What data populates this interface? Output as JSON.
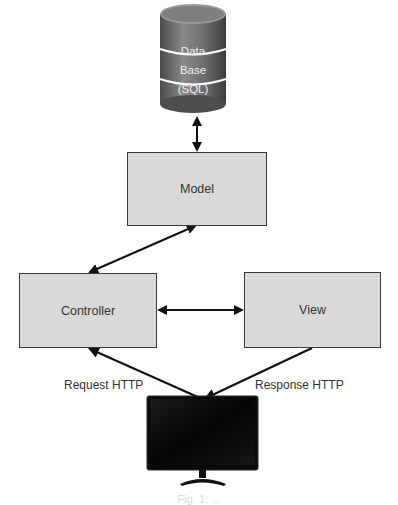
{
  "diagram": {
    "type": "MVC architecture",
    "database": {
      "lines": [
        "Data",
        "Base",
        "(SQL)"
      ]
    },
    "nodes": {
      "model": "Model",
      "controller": "Controller",
      "view": "View",
      "client": "Monitor"
    },
    "edge_labels": {
      "request": "Request HTTP",
      "response": "Response HTTP"
    },
    "edges": [
      {
        "from": "database",
        "to": "model",
        "direction": "both"
      },
      {
        "from": "model",
        "to": "controller",
        "direction": "both"
      },
      {
        "from": "controller",
        "to": "view",
        "direction": "both"
      },
      {
        "from": "client",
        "to": "controller",
        "label": "Request HTTP"
      },
      {
        "from": "view",
        "to": "client",
        "label": "Response HTTP"
      }
    ],
    "colors": {
      "box_fill": "#d9d9d9",
      "box_border": "#3a3a3a",
      "arrow": "#111111",
      "db": "#6b6b6b"
    },
    "caption": "Fig. 1: ..."
  }
}
